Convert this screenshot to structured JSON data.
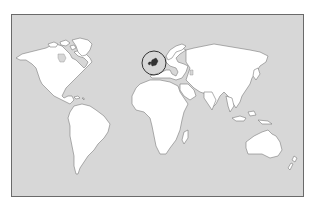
{
  "map": {
    "type": "world-outline-map",
    "projection": "equirectangular-like",
    "ocean_color": "#d7d7d7",
    "land_color": "#ffffff",
    "outline_color": "#7a7a7a",
    "frame_color": "#6a6a6a",
    "highlight": {
      "region": "British Isles",
      "marker": "circle",
      "fill_color": "#333333",
      "ring_color": "#333333"
    },
    "regions_shown": [
      "North America",
      "Greenland",
      "South America",
      "Europe",
      "Africa",
      "Asia",
      "Australia",
      "New Zealand",
      "Madagascar",
      "Japan",
      "Indonesia"
    ]
  }
}
